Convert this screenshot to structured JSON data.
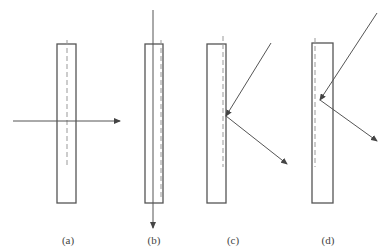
{
  "diagram": {
    "colors": {
      "stroke": "#555555",
      "dash": "#999999",
      "background": "#ffffff"
    },
    "panels": [
      {
        "label": "(a)",
        "slab": {
          "x": 57,
          "y": 44,
          "w": 19,
          "h": 159
        },
        "dashed_line": {
          "x": 67,
          "y1": 40,
          "y2": 167
        },
        "rays": [
          {
            "x1": 13,
            "y1": 121,
            "x2": 120,
            "y2": 121,
            "arrow": true
          }
        ]
      },
      {
        "label": "(b)",
        "slab": {
          "x": 145,
          "y": 44,
          "w": 18,
          "h": 159
        },
        "dashed_line": {
          "x": 161,
          "y1": 40,
          "y2": 200
        },
        "rays": [
          {
            "x1": 153,
            "y1": 10,
            "x2": 153,
            "y2": 228,
            "arrow": true
          }
        ]
      },
      {
        "label": "(c)",
        "slab": {
          "x": 207,
          "y": 44,
          "w": 19,
          "h": 159
        },
        "dashed_line": {
          "x": 223,
          "y1": 36,
          "y2": 167
        },
        "rays": [
          {
            "x1": 271,
            "y1": 43,
            "x2": 226,
            "y2": 116,
            "arrow": true
          },
          {
            "x1": 226,
            "y1": 116,
            "x2": 287,
            "y2": 164,
            "arrow": true
          }
        ]
      },
      {
        "label": "(d)",
        "slab": {
          "x": 312,
          "y": 43,
          "w": 21,
          "h": 160
        },
        "dashed_line": {
          "x": 315,
          "y1": 38,
          "y2": 167
        },
        "rays": [
          {
            "x1": 377,
            "y1": 13,
            "x2": 320,
            "y2": 100,
            "arrow": true
          },
          {
            "x1": 320,
            "y1": 100,
            "x2": 377,
            "y2": 141,
            "arrow": true
          }
        ]
      }
    ],
    "label_positions": [
      {
        "x": 68,
        "y": 244
      },
      {
        "x": 154,
        "y": 244
      },
      {
        "x": 233,
        "y": 244
      },
      {
        "x": 328,
        "y": 244
      }
    ]
  }
}
